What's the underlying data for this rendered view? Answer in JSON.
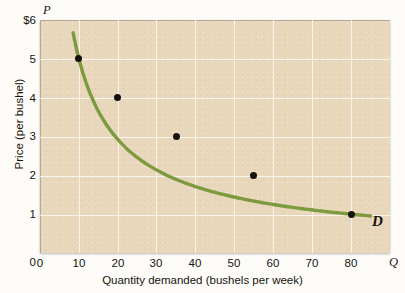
{
  "chart_data": {
    "type": "line",
    "title": "",
    "subtitle": "",
    "xlabel": "Quantity demanded (bushels per week)",
    "ylabel": "Price (per bushel)",
    "x_axis_symbol": "Q",
    "y_axis_symbol": "P",
    "xlim": [
      0,
      90
    ],
    "ylim": [
      0,
      6
    ],
    "grid": true,
    "legend_position": "inline-right",
    "xticks": [
      {
        "value": 0,
        "label": "0"
      },
      {
        "value": 10,
        "label": "10"
      },
      {
        "value": 20,
        "label": "20"
      },
      {
        "value": 30,
        "label": "30"
      },
      {
        "value": 40,
        "label": "40"
      },
      {
        "value": 50,
        "label": "50"
      },
      {
        "value": 60,
        "label": "60"
      },
      {
        "value": 70,
        "label": "70"
      },
      {
        "value": 80,
        "label": "80"
      }
    ],
    "yticks": [
      {
        "value": 6,
        "label": "$6"
      },
      {
        "value": 5,
        "label": "5"
      },
      {
        "value": 4,
        "label": "4"
      },
      {
        "value": 3,
        "label": "3"
      },
      {
        "value": 2,
        "label": "2"
      },
      {
        "value": 1,
        "label": "1"
      },
      {
        "value": 0,
        "label": "0"
      }
    ],
    "series": [
      {
        "name": "D",
        "annotation": "D",
        "color": "#7d9a3f",
        "marker_color": "#14120e",
        "x": [
          10,
          20,
          35,
          55,
          80
        ],
        "y": [
          5,
          4,
          3,
          2,
          1
        ],
        "curve_x_start": 8.5,
        "curve_y_start": 5.3,
        "curve_x_end": 85,
        "curve_y_end": 0.85
      }
    ],
    "colors": {
      "plot_background": "#e9d7bb",
      "gridline": "#ffffff",
      "curve": "#7d9a3f",
      "point": "#14120e",
      "text": "#16140f",
      "border": "#b3a893",
      "page_background": "#fdfcf8"
    }
  }
}
